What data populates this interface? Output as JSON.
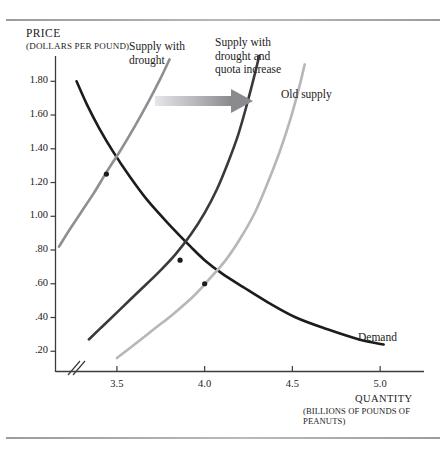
{
  "figure": {
    "background": "#ffffff",
    "rule_color": "#a6a6ab"
  },
  "chart_data": {
    "type": "line",
    "title": "",
    "xlabel": "QUANTITY",
    "xlabel_sub": "(BILLIONS OF POUNDS OF PEANUTS)",
    "ylabel": "PRICE",
    "ylabel_sub": "(DOLLARS PER POUND)",
    "xlim": [
      3.15,
      5.25
    ],
    "ylim": [
      0.08,
      1.95
    ],
    "xticks": [
      "3.5",
      "4.0",
      "4.5",
      "5.0"
    ],
    "xtick_values": [
      3.5,
      4.0,
      4.5,
      5.0
    ],
    "yticks": [
      "1.80",
      "1.60",
      "1.40",
      "1.20",
      "1.00",
      ".80",
      ".60",
      ".40",
      ".20"
    ],
    "ytick_values": [
      1.8,
      1.6,
      1.4,
      1.2,
      1.0,
      0.8,
      0.6,
      0.4,
      0.2
    ],
    "grid": false,
    "axis_break": true,
    "legend_position": "inline-labels",
    "series": [
      {
        "name": "Demand",
        "label": "Demand",
        "color": "#1c1c1c",
        "width": 2.6,
        "points": [
          [
            3.27,
            1.8
          ],
          [
            3.33,
            1.66
          ],
          [
            3.4,
            1.52
          ],
          [
            3.48,
            1.38
          ],
          [
            3.57,
            1.24
          ],
          [
            3.67,
            1.1
          ],
          [
            3.79,
            0.96
          ],
          [
            3.92,
            0.82
          ],
          [
            4.0,
            0.74
          ],
          [
            4.1,
            0.66
          ],
          [
            4.22,
            0.58
          ],
          [
            4.36,
            0.49
          ],
          [
            4.52,
            0.4
          ],
          [
            4.7,
            0.33
          ],
          [
            4.88,
            0.27
          ],
          [
            5.02,
            0.24
          ]
        ]
      },
      {
        "name": "Supply with drought",
        "label": "Supply with\ndrought",
        "color": "#8e8e93",
        "width": 2.6,
        "points": [
          [
            3.17,
            0.82
          ],
          [
            3.23,
            0.92
          ],
          [
            3.3,
            1.03
          ],
          [
            3.37,
            1.14
          ],
          [
            3.44,
            1.26
          ],
          [
            3.52,
            1.39
          ],
          [
            3.6,
            1.53
          ],
          [
            3.68,
            1.68
          ],
          [
            3.75,
            1.82
          ],
          [
            3.8,
            1.93
          ]
        ]
      },
      {
        "name": "Supply with drought and quota increase",
        "label": "Supply with\ndrought and\nquota increase",
        "color": "#3a3a3e",
        "width": 2.6,
        "points": [
          [
            3.34,
            0.27
          ],
          [
            3.42,
            0.35
          ],
          [
            3.52,
            0.45
          ],
          [
            3.63,
            0.56
          ],
          [
            3.73,
            0.66
          ],
          [
            3.83,
            0.77
          ],
          [
            3.92,
            0.89
          ],
          [
            4.0,
            1.02
          ],
          [
            4.07,
            1.16
          ],
          [
            4.13,
            1.31
          ],
          [
            4.19,
            1.48
          ],
          [
            4.24,
            1.66
          ],
          [
            4.29,
            1.86
          ],
          [
            4.31,
            1.95
          ]
        ]
      },
      {
        "name": "Old supply",
        "label": "Old supply",
        "color": "#b6b6bb",
        "width": 2.6,
        "points": [
          [
            3.5,
            0.16
          ],
          [
            3.6,
            0.24
          ],
          [
            3.71,
            0.33
          ],
          [
            3.82,
            0.42
          ],
          [
            3.93,
            0.52
          ],
          [
            4.02,
            0.62
          ],
          [
            4.12,
            0.74
          ],
          [
            4.21,
            0.88
          ],
          [
            4.29,
            1.03
          ],
          [
            4.36,
            1.2
          ],
          [
            4.43,
            1.39
          ],
          [
            4.49,
            1.58
          ],
          [
            4.54,
            1.77
          ],
          [
            4.57,
            1.9
          ]
        ]
      }
    ],
    "equilibria": [
      {
        "name": "old-equilibrium",
        "x": 4.0,
        "y": 0.6
      },
      {
        "name": "drought-quota-equilibrium",
        "x": 3.86,
        "y": 0.74
      },
      {
        "name": "drought-equilibrium",
        "x": 3.44,
        "y": 1.25
      }
    ],
    "annotations": [
      {
        "name": "shift-arrow",
        "type": "arrow",
        "direction": "right",
        "from_px": [
          155,
          101
        ],
        "to_px": [
          245,
          101
        ],
        "color_start": "#e2e2e5",
        "color_end": "#8a8a8f"
      }
    ]
  }
}
